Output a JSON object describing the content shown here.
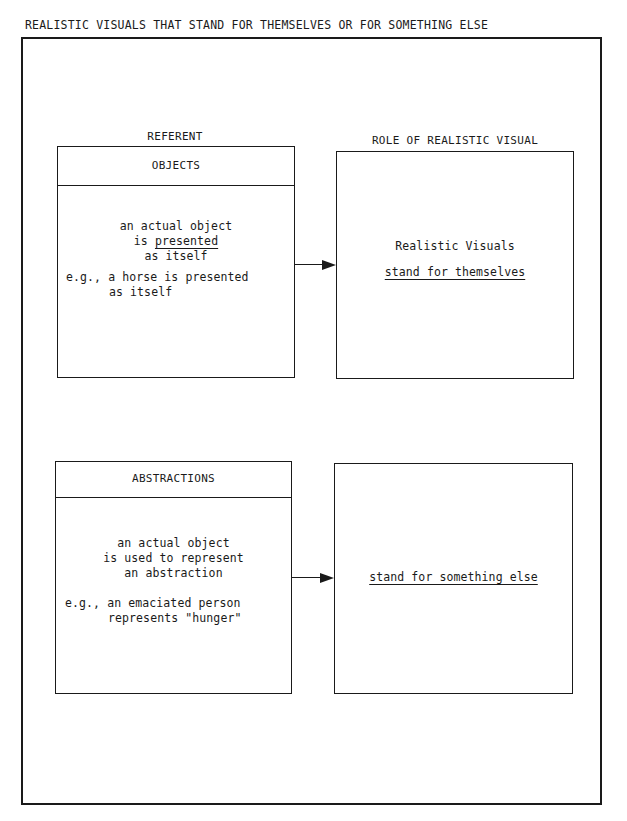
{
  "title": "REALISTIC VISUALS THAT STAND FOR THEMSELVES OR FOR SOMETHING ELSE",
  "columns": {
    "left_label": "REFERENT",
    "right_label": "ROLE OF REALISTIC VISUAL"
  },
  "rows": [
    {
      "referent": {
        "header": "OBJECTS",
        "lines": [
          "an actual object",
          "is",
          "presented",
          "as itself"
        ],
        "example_lines": [
          "e.g., a horse is presented",
          "as itself"
        ]
      },
      "role": {
        "line1": "Realistic Visuals",
        "line2": "stand for themselves"
      }
    },
    {
      "referent": {
        "header": "ABSTRACTIONS",
        "lines": [
          "an actual object",
          "is used to represent",
          "an abstraction"
        ],
        "example_lines": [
          "e.g., an emaciated person",
          "represents \"hunger\""
        ]
      },
      "role": {
        "line1": "stand for something else"
      }
    }
  ]
}
